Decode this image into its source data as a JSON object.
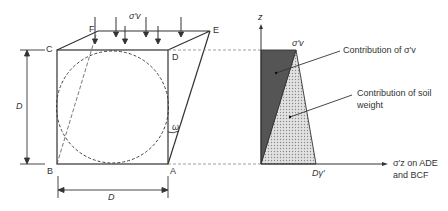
{
  "diagram": {
    "left_figure": {
      "points": {
        "A": "A",
        "B": "B",
        "C": "C",
        "D": "D",
        "E": "E",
        "F": "F"
      },
      "surcharge_label": "σ′v",
      "dimension_vertical": "D",
      "dimension_horizontal": "D",
      "angle_label": "ω"
    },
    "right_figure": {
      "z_axis_label": "z",
      "top_value_label": "σ′v",
      "bottom_value_label": "Dγ′",
      "x_axis_label_line1": "σ′z on ADE",
      "x_axis_label_line2": "and BCF",
      "annotation_surcharge": "Contribution of σ′v",
      "annotation_soil_line1": "Contribution of soil",
      "annotation_soil_line2": "weight"
    },
    "colors": {
      "line": "#333333",
      "dark_fill": "#555555",
      "light_fill": "#d4d4d4",
      "dashed": "#777777"
    }
  }
}
